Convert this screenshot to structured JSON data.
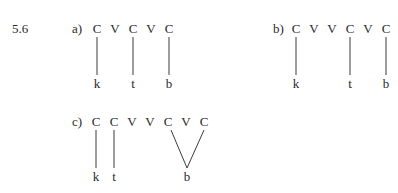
{
  "exercise_number": "5.6",
  "parts": [
    {
      "label": "a)",
      "skeleton": [
        "C",
        "V",
        "C",
        "V",
        "C"
      ],
      "segments": [
        "k",
        "t",
        "b"
      ],
      "links": [
        [
          0,
          0
        ],
        [
          2,
          1
        ],
        [
          4,
          2
        ]
      ]
    },
    {
      "label": "b)",
      "skeleton": [
        "C",
        "V",
        "V",
        "C",
        "V",
        "C"
      ],
      "segments": [
        "k",
        "t",
        "b"
      ],
      "links": [
        [
          0,
          0
        ],
        [
          3,
          1
        ],
        [
          5,
          2
        ]
      ]
    },
    {
      "label": "c)",
      "skeleton": [
        "C",
        "C",
        "V",
        "V",
        "C",
        "V",
        "C"
      ],
      "segments": [
        "k",
        "t",
        "b"
      ],
      "links": [
        [
          0,
          0
        ],
        [
          1,
          1
        ],
        [
          4,
          2
        ],
        [
          6,
          2
        ]
      ]
    }
  ]
}
